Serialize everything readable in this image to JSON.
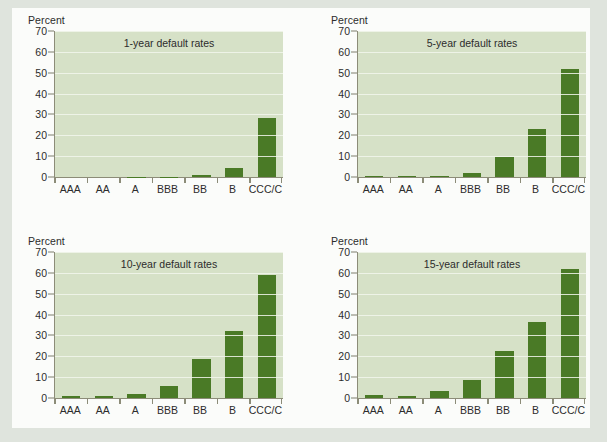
{
  "figure": {
    "panel_count": 4,
    "y_axis_title": "Percent",
    "categories": [
      "AAA",
      "AA",
      "A",
      "BBB",
      "BB",
      "B",
      "CCC/C"
    ],
    "y_ticks": [
      0,
      10,
      20,
      30,
      40,
      50,
      60,
      70
    ],
    "colors": {
      "bar": "#4a7a26",
      "plot_background": "#d6e1c7",
      "gridline": "#f2f6ec",
      "page_background": "#dfe4dd",
      "paper": "#fbfcfa",
      "axis": "#8c8c78",
      "text": "#2c2c2c"
    }
  },
  "chart_data": [
    {
      "type": "bar",
      "title": "1-year default rates",
      "xlabel": "",
      "ylabel": "Percent",
      "ylim": [
        0,
        70
      ],
      "yticks": [
        0,
        10,
        20,
        30,
        40,
        50,
        60,
        70
      ],
      "grid": true,
      "legend": "none",
      "categories": [
        "AAA",
        "AA",
        "A",
        "BBB",
        "BB",
        "B",
        "CCC/C"
      ],
      "values": [
        0.0,
        0.0,
        0.05,
        0.2,
        0.8,
        4.5,
        28.5
      ]
    },
    {
      "type": "bar",
      "title": "5-year default rates",
      "xlabel": "",
      "ylabel": "Percent",
      "ylim": [
        0,
        70
      ],
      "yticks": [
        0,
        10,
        20,
        30,
        40,
        50,
        60,
        70
      ],
      "grid": true,
      "legend": "none",
      "categories": [
        "AAA",
        "AA",
        "A",
        "BBB",
        "BB",
        "B",
        "CCC/C"
      ],
      "values": [
        0.4,
        0.4,
        0.7,
        2.1,
        9.7,
        23.0,
        52.0
      ]
    },
    {
      "type": "bar",
      "title": "10-year default rates",
      "xlabel": "",
      "ylabel": "Percent",
      "ylim": [
        0,
        70
      ],
      "yticks": [
        0,
        10,
        20,
        30,
        40,
        50,
        60,
        70
      ],
      "grid": true,
      "legend": "none",
      "categories": [
        "AAA",
        "AA",
        "A",
        "BBB",
        "BB",
        "B",
        "CCC/C"
      ],
      "values": [
        0.8,
        0.8,
        1.8,
        6.0,
        18.7,
        32.0,
        59.0
      ]
    },
    {
      "type": "bar",
      "title": "15-year default rates",
      "xlabel": "",
      "ylabel": "Percent",
      "ylim": [
        0,
        70
      ],
      "yticks": [
        0,
        10,
        20,
        30,
        40,
        50,
        60,
        70
      ],
      "grid": true,
      "legend": "none",
      "categories": [
        "AAA",
        "AA",
        "A",
        "BBB",
        "BB",
        "B",
        "CCC/C"
      ],
      "values": [
        1.5,
        1.2,
        3.3,
        8.6,
        22.5,
        36.5,
        62.0
      ]
    }
  ]
}
